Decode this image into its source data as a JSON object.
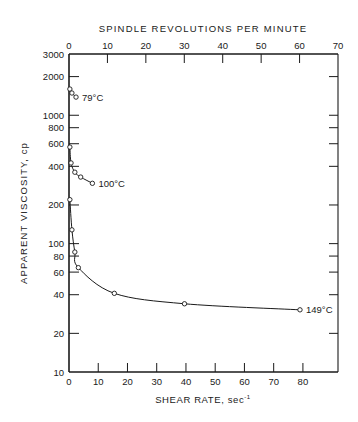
{
  "chart_data": {
    "type": "line",
    "title": "",
    "xlabel": "SHEAR RATE, sec",
    "xlabel_superscript": "-1",
    "x2label": "SPINDLE REVOLUTIONS PER MINUTE",
    "ylabel": "APPARENT VISCOSITY, cp",
    "yscale": "log",
    "xlim": [
      0,
      92
    ],
    "x2lim": [
      0,
      70
    ],
    "ylim": [
      10,
      3000
    ],
    "x_ticks": [
      0,
      10,
      20,
      30,
      40,
      50,
      60,
      70,
      80
    ],
    "x2_ticks": [
      0,
      10,
      20,
      30,
      40,
      50,
      60,
      70
    ],
    "y_ticks": [
      3000,
      2000,
      1000,
      800,
      600,
      400,
      200,
      100,
      80,
      60,
      40,
      20,
      10
    ],
    "grid": false,
    "legend": "inline labels at curve ends",
    "series": [
      {
        "name": "79°C",
        "label": "79°C",
        "x": [
          0.3,
          1.0,
          2.4
        ],
        "y": [
          1600,
          1490,
          1385
        ]
      },
      {
        "name": "100°C",
        "label": "100°C",
        "x": [
          0.3,
          0.7,
          2.0,
          4.0,
          8.0
        ],
        "y": [
          565,
          425,
          360,
          330,
          295
        ]
      },
      {
        "name": "149°C",
        "label": "149°C",
        "x": [
          0.3,
          1.0,
          2.0,
          3.2,
          15.5,
          39.5,
          79.0
        ],
        "y": [
          220,
          128,
          86,
          65,
          41,
          34,
          30.5
        ]
      }
    ]
  }
}
